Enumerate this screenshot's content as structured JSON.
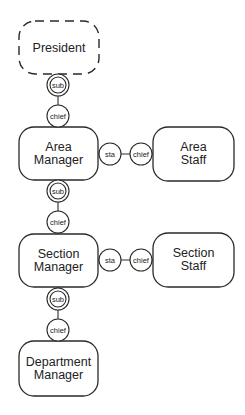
{
  "diagram": {
    "type": "organization-role-hierarchy",
    "nodes": [
      {
        "id": "president",
        "line1": "President",
        "line2": "",
        "style": "dashed"
      },
      {
        "id": "area_manager",
        "line1": "Area",
        "line2": "Manager",
        "style": "solid"
      },
      {
        "id": "area_staff",
        "line1": "Area",
        "line2": "Staff",
        "style": "solid"
      },
      {
        "id": "section_manager",
        "line1": "Section",
        "line2": "Manager",
        "style": "solid"
      },
      {
        "id": "section_staff",
        "line1": "Section",
        "line2": "Staff",
        "style": "solid"
      },
      {
        "id": "department_manager",
        "line1": "Department",
        "line2": "Manager",
        "style": "solid"
      }
    ],
    "connector_labels": {
      "sub": "sub",
      "chief": "chief",
      "sta": "sta"
    },
    "edges": [
      {
        "from": "president",
        "to": "area_manager",
        "from_role": "sub",
        "to_role": "chief"
      },
      {
        "from": "area_manager",
        "to": "area_staff",
        "from_role": "sta",
        "to_role": "chief"
      },
      {
        "from": "area_manager",
        "to": "section_manager",
        "from_role": "sub",
        "to_role": "chief"
      },
      {
        "from": "section_manager",
        "to": "section_staff",
        "from_role": "sta",
        "to_role": "chief"
      },
      {
        "from": "section_manager",
        "to": "department_manager",
        "from_role": "sub",
        "to_role": "chief"
      }
    ]
  }
}
